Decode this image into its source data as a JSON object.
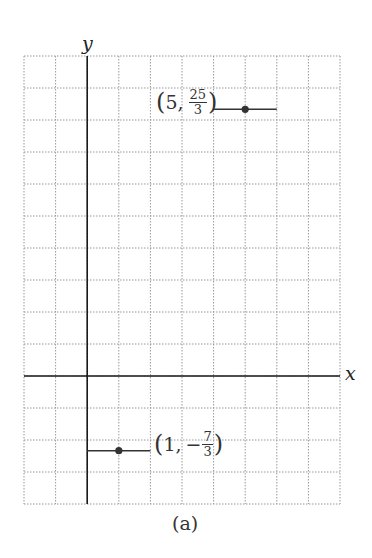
{
  "chart_data": {
    "type": "line",
    "title": "",
    "caption": "(a)",
    "xlabel": "x",
    "ylabel": "y",
    "xlim": [
      -2,
      8
    ],
    "ylim": [
      -4,
      10
    ],
    "grid": true,
    "grid_style": "dotted",
    "series": [
      {
        "name": "upper segment",
        "x": [
          4,
          6
        ],
        "y": [
          8.3333,
          8.3333
        ],
        "marker": {
          "x": 5,
          "y": 8.3333,
          "label": "(5, 25/3)",
          "label_parts": {
            "open": "(",
            "x": "5,",
            "num": "25",
            "den": "3",
            "close": ")"
          }
        }
      },
      {
        "name": "lower segment",
        "x": [
          0,
          2
        ],
        "y": [
          -2.3333,
          -2.3333
        ],
        "marker": {
          "x": 1,
          "y": -2.3333,
          "label": "(1, −7/3)",
          "label_parts": {
            "open": "(",
            "x": "1,",
            "sign": "−",
            "num": "7",
            "den": "3",
            "close": ")"
          }
        }
      }
    ]
  },
  "colors": {
    "grid": "#9a9a9a",
    "axis": "#1a1a1a",
    "segment": "#333333",
    "point": "#333333"
  },
  "labels": {
    "x_axis": "x",
    "y_axis": "y",
    "caption": "(a)"
  }
}
